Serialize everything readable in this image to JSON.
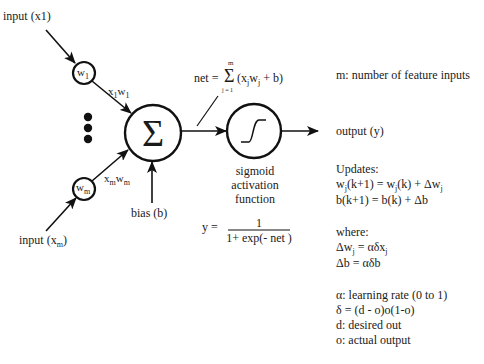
{
  "inputs": {
    "input1_label": "input (x1)",
    "inputm_label_prefix": "input (x",
    "inputm_label_sub": "m",
    "inputm_label_suffix": ")"
  },
  "weights": {
    "w1": "w",
    "w1_sub": "1",
    "wm": "w",
    "wm_sub": "m",
    "x1w1": {
      "a": "x",
      "a_sub": "1",
      "b": "w",
      "b_sub": "1"
    },
    "xmwm": {
      "a": "x",
      "a_sub": "m",
      "b": "w",
      "b_sub": "m"
    }
  },
  "summation": {
    "symbol": "Σ",
    "bias_label": "bias (b)",
    "net_prefix": "net =",
    "net_sigma": "Σ",
    "net_upper": "m",
    "net_lower": "j = 1",
    "net_body_1": "(x",
    "net_body_j1": "j",
    "net_body_2": "w",
    "net_body_j2": "j",
    "net_body_3": " + b)"
  },
  "activation": {
    "caption_line1": "sigmoid",
    "caption_line2": "activation",
    "caption_line3": "function",
    "formula_lhs": "y =",
    "formula_num": "1",
    "formula_den": "1+ exp(- net )"
  },
  "output": {
    "label": "output (y)"
  },
  "notes": {
    "m_def": "m: number of feature inputs",
    "updates_title": "Updates:",
    "update_w": {
      "a": "w",
      "a_sub": "j",
      "b": "(k+1) = w",
      "b_sub": "j",
      "c": "(k) + Δw",
      "c_sub": "j"
    },
    "update_b": "b(k+1) = b(k) +  Δb",
    "where_title": "where:",
    "delta_w": {
      "a": "Δw",
      "a_sub": "j",
      "b": " = αδx",
      "b_sub": "j"
    },
    "delta_b": "Δb = αδb",
    "alpha_def": "α: learning rate (0 to 1)",
    "delta_def": "δ = (d - o)o(1-o)",
    "d_def": "d: desired out",
    "o_def": "o: actual output"
  }
}
